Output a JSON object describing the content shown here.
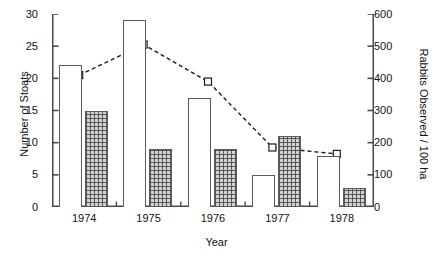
{
  "chart_data": {
    "type": "bar",
    "title": "",
    "subtitle": "",
    "xlabel": "Year",
    "ylabel": "Number of Stoats",
    "ylabel_secondary": "Rabbits Observed / 100 ha",
    "categories": [
      "1974",
      "1975",
      "1976",
      "1977",
      "1978"
    ],
    "ylim": [
      0,
      30
    ],
    "yticks": [
      0,
      5,
      10,
      15,
      20,
      25,
      30
    ],
    "ylim_secondary": [
      0,
      600
    ],
    "yticks_secondary": [
      0,
      100,
      200,
      300,
      400,
      500,
      600
    ],
    "grid": false,
    "legend": "none",
    "series": [
      {
        "name": "Stoats (open bars)",
        "type": "bar",
        "axis": "left",
        "style": "open",
        "values": [
          22,
          29,
          17,
          5,
          8
        ]
      },
      {
        "name": "Stoats (hatched bars)",
        "type": "bar",
        "axis": "left",
        "style": "crosshatch",
        "values": [
          15,
          9,
          9,
          11,
          3
        ]
      },
      {
        "name": "Rabbits Observed / 100 ha",
        "type": "line",
        "axis": "right",
        "style": "dashed-open-square",
        "values": [
          410,
          505,
          390,
          185,
          165
        ]
      }
    ]
  },
  "axes": {
    "left_tick_labels": [
      "30",
      "25",
      "20",
      "15",
      "10",
      "5",
      "0"
    ],
    "right_tick_labels": [
      "600",
      "500",
      "400",
      "300",
      "200",
      "100",
      "0"
    ],
    "x_tick_labels": [
      "1974",
      "1975",
      "1976",
      "1977",
      "1978"
    ],
    "y_title_left": "Number of Stoats",
    "y_title_right": "Rabbits Observed / 100 ha",
    "x_title": "Year"
  },
  "colors": {
    "axis": "#4a4a4a",
    "bar_outline": "#5a5a5a",
    "bar_open_fill": "#ffffff",
    "bar_hatch_fill": "#d2d2d2",
    "line": "#1a1a1a",
    "marker_fill": "#ffffff",
    "text": "#111111",
    "background": "#ffffff"
  }
}
